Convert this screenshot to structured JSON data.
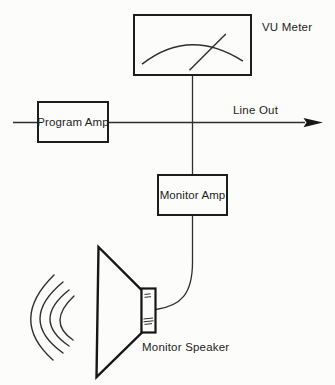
{
  "diagram": {
    "type": "audio-monitoring-block-diagram",
    "labels": {
      "vu_meter": "VU Meter",
      "program_amp": "Program Amp",
      "line_out": "Line Out",
      "monitor_amp": "Monitor Amp",
      "monitor_speaker": "Monitor Speaker"
    },
    "colors": {
      "background": "#fcfcfa",
      "line": "#2e2e2e",
      "bold_outline": "#1d1d1d",
      "text": "#1d1d1d"
    },
    "connections": [
      "input -> Program Amp",
      "Program Amp -> Line Out (arrow right)",
      "signal line -> VU Meter (branch up)",
      "signal line -> Monitor Amp (branch down)",
      "Monitor Amp -> Monitor Speaker (curved cable)"
    ]
  }
}
